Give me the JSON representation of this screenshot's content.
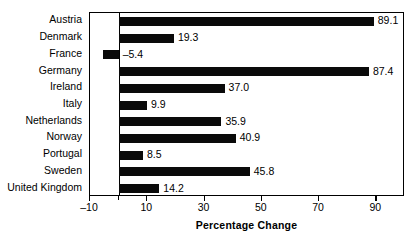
{
  "chart_data": {
    "type": "bar",
    "orientation": "horizontal",
    "title": "",
    "subtitle": "",
    "xlabel": "Percentage Change",
    "ylabel": "",
    "categories": [
      "Austria",
      "Denmark",
      "France",
      "Germany",
      "Ireland",
      "Italy",
      "Netherlands",
      "Norway",
      "Portugal",
      "Sweden",
      "United Kingdom"
    ],
    "values": [
      89.1,
      19.3,
      -5.4,
      87.4,
      37.0,
      9.9,
      35.9,
      40.9,
      8.5,
      45.8,
      14.2
    ],
    "value_labels": [
      "89.1",
      "19.3",
      "–5.4",
      "87.4",
      "37.0",
      "9.9",
      "35.9",
      "40.9",
      "8.5",
      "45.8",
      "14.2"
    ],
    "xlim": [
      -10,
      100
    ],
    "xticks": [
      -10,
      10,
      30,
      50,
      70,
      90
    ],
    "xtick_labels": [
      "–10",
      "10",
      "30",
      "50",
      "70",
      "90"
    ],
    "minor_xticks": [
      0
    ],
    "grid": false,
    "legend": false,
    "bar_color": "#0a0a0a",
    "frame_color": "#000000",
    "background": "#ffffff"
  }
}
